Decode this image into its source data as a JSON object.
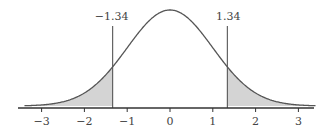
{
  "chart_data": {
    "type": "area",
    "title": "",
    "xlabel": "",
    "ylabel": "",
    "distribution": "standard normal",
    "x_ticks": [
      -3,
      -2,
      -1,
      0,
      1,
      2,
      3
    ],
    "x_tick_labels": [
      "−3",
      "−2",
      "−1",
      "0",
      "1",
      "2",
      "3"
    ],
    "xlim": [
      -3.4,
      3.4
    ],
    "grid": false,
    "critical_values": [
      -1.34,
      1.34
    ],
    "critical_labels": [
      "−1.34",
      "1.34"
    ],
    "shaded_regions": [
      {
        "from": -3.4,
        "to": -1.34,
        "label": "left tail"
      },
      {
        "from": 1.34,
        "to": 3.4,
        "label": "right tail"
      }
    ],
    "colors": {
      "curve": "#555555",
      "shade": "#d4d4d4",
      "axis": "#333333"
    }
  }
}
